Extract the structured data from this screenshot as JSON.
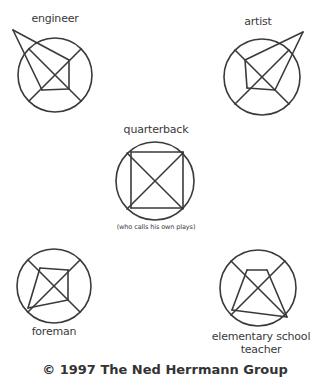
{
  "diagrams": [
    {
      "id": "engineer",
      "label": "engineer",
      "circle": {
        "cx": 55,
        "cy": 75,
        "r": 37
      },
      "label_pos": {
        "x": 55,
        "y": 13
      },
      "lines": [
        [
          13,
          30,
          69,
          60
        ],
        [
          13,
          30,
          42,
          90
        ],
        [
          69,
          60,
          69,
          89
        ],
        [
          69,
          89,
          42,
          90
        ],
        [
          29,
          49,
          81,
          101
        ],
        [
          81,
          49,
          29,
          101
        ]
      ]
    },
    {
      "id": "artist",
      "label": "artist",
      "circle": {
        "cx": 262,
        "cy": 77,
        "r": 38
      },
      "label_pos": {
        "x": 258,
        "y": 16
      },
      "lines": [
        [
          303,
          32,
          245,
          60
        ],
        [
          303,
          32,
          275,
          90
        ],
        [
          245,
          60,
          247,
          88
        ],
        [
          247,
          88,
          275,
          90
        ],
        [
          235,
          50,
          289,
          104
        ],
        [
          289,
          50,
          235,
          104
        ]
      ]
    },
    {
      "id": "quarterback",
      "label": "quarterback",
      "sublabel": "(who calls his own plays)",
      "circle": {
        "cx": 155,
        "cy": 181,
        "r": 39
      },
      "label_pos": {
        "x": 156,
        "y": 124
      },
      "sublabel_pos": {
        "x": 156,
        "y": 224
      },
      "lines": [
        [
          131,
          152,
          183,
          152
        ],
        [
          183,
          152,
          183,
          208
        ],
        [
          183,
          208,
          131,
          208
        ],
        [
          131,
          208,
          131,
          152
        ],
        [
          127,
          153,
          183,
          209
        ],
        [
          183,
          153,
          127,
          209
        ]
      ]
    },
    {
      "id": "foreman",
      "label": "foreman",
      "circle": {
        "cx": 54,
        "cy": 286,
        "r": 37
      },
      "label_pos": {
        "x": 54,
        "y": 326
      },
      "lines": [
        [
          40,
          268,
          68,
          270
        ],
        [
          68,
          270,
          68,
          300
        ],
        [
          28,
          308,
          40,
          268
        ],
        [
          28,
          308,
          68,
          300
        ],
        [
          28,
          260,
          80,
          312
        ],
        [
          80,
          260,
          28,
          312
        ]
      ]
    },
    {
      "id": "elementary-school-teacher",
      "label": "elementary school",
      "label2": "teacher",
      "circle": {
        "cx": 258,
        "cy": 288,
        "r": 38
      },
      "label_pos": {
        "x": 261,
        "y": 331
      },
      "label2_pos": {
        "x": 261,
        "y": 344
      },
      "lines": [
        [
          247,
          270,
          267,
          270
        ],
        [
          247,
          270,
          232,
          310
        ],
        [
          267,
          270,
          287,
          317
        ],
        [
          232,
          310,
          287,
          317
        ],
        [
          231,
          261,
          285,
          315
        ],
        [
          285,
          261,
          231,
          315
        ]
      ]
    }
  ],
  "footer": {
    "copyright": "© 1997 The Ned Herrmann Group"
  },
  "style": {
    "stroke": "#3a3a3a",
    "stroke_width": 1.6
  }
}
